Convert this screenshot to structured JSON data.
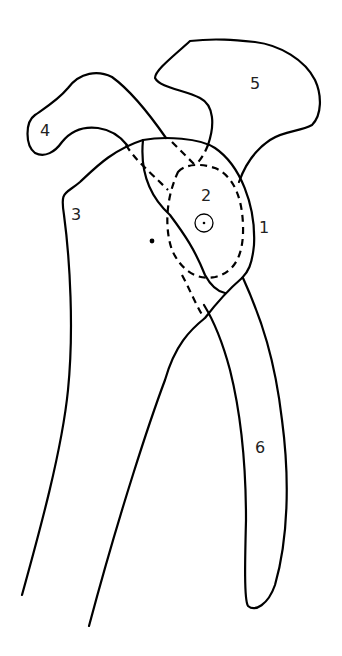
{
  "diagram": {
    "type": "anatomical line drawing",
    "labels": [
      {
        "id": "1",
        "text": "1",
        "x": 259,
        "y": 220
      },
      {
        "id": "2",
        "text": "2",
        "x": 201,
        "y": 188
      },
      {
        "id": "3",
        "text": "3",
        "x": 71,
        "y": 207
      },
      {
        "id": "4",
        "text": "4",
        "x": 40,
        "y": 123
      },
      {
        "id": "5",
        "text": "5",
        "x": 250,
        "y": 76
      },
      {
        "id": "6",
        "text": "6",
        "x": 255,
        "y": 440
      }
    ],
    "markers": {
      "center_circle": {
        "cx": 204,
        "cy": 223,
        "r": 9
      },
      "dot": {
        "cx": 152,
        "cy": 241
      }
    },
    "colors": {
      "stroke": "#000000",
      "background": "#ffffff"
    }
  }
}
